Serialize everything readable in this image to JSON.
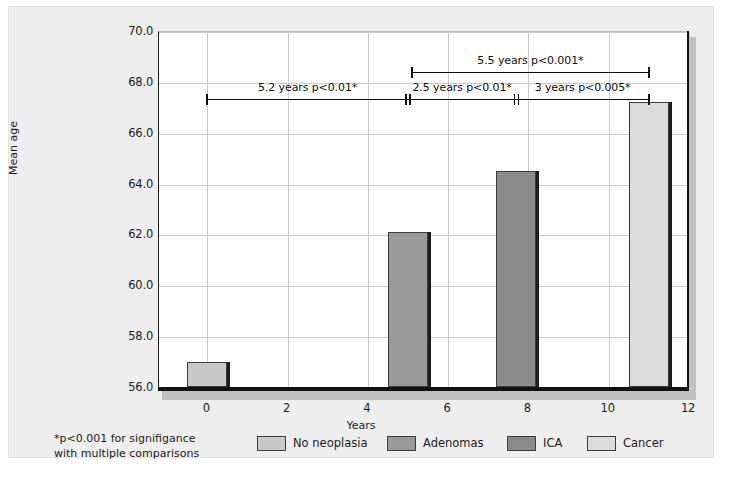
{
  "figure": {
    "background_color": "#eeeeee",
    "plot_background_color": "#ffffff"
  },
  "chart_data": {
    "type": "bar",
    "title": "",
    "xlabel": "Years",
    "ylabel": "Mean age",
    "xlim": [
      -1.2,
      12
    ],
    "ylim": [
      56.0,
      70.0
    ],
    "xticks": [
      "0",
      "2",
      "4",
      "6",
      "8",
      "10",
      "12"
    ],
    "xtick_values": [
      0,
      2,
      4,
      6,
      8,
      10,
      12
    ],
    "yticks": [
      "56.0",
      "58.0",
      "60.0",
      "62.0",
      "64.0",
      "66.0",
      "68.0",
      "70.0"
    ],
    "ytick_values": [
      56.0,
      58.0,
      60.0,
      62.0,
      64.0,
      66.0,
      68.0,
      70.0
    ],
    "grid": true,
    "legend_position": "bottom",
    "categories": [
      "No neoplasia",
      "Adenomas",
      "ICA",
      "Cancer"
    ],
    "values": [
      57.0,
      62.1,
      64.5,
      67.2
    ],
    "x": [
      0.0,
      5.0,
      7.7,
      11.0
    ],
    "bar_width_years": 1.0,
    "colors": [
      "#c8c8c8",
      "#9a9a9a",
      "#8a8a8a",
      "#dcdcdc"
    ],
    "series": [
      {
        "name": "No neoplasia",
        "x": 0.0,
        "value": 57.0,
        "color": "#c8c8c8"
      },
      {
        "name": "Adenomas",
        "x": 5.0,
        "value": 62.1,
        "color": "#9a9a9a"
      },
      {
        "name": "ICA",
        "x": 7.7,
        "value": 64.5,
        "color": "#8a8a8a"
      },
      {
        "name": "Cancer",
        "x": 11.0,
        "value": 67.2,
        "color": "#dcdcdc"
      }
    ],
    "annotations": [
      {
        "label": "5.2 years p<0.01*",
        "x_start": 0.0,
        "x_end": 5.0,
        "row": 2,
        "cap_left": "single",
        "cap_right": "double"
      },
      {
        "label": "5.5 years p<0.001*",
        "x_start": 5.1,
        "x_end": 11.0,
        "row": 1,
        "cap_left": "single",
        "cap_right": "single"
      },
      {
        "label": "2.5 years p<0.01*",
        "x_start": 5.0,
        "x_end": 7.7,
        "row": 2,
        "cap_left": "double",
        "cap_right": "double"
      },
      {
        "label": "3 years p<0.005*",
        "x_start": 7.7,
        "x_end": 11.0,
        "row": 2,
        "cap_left": "double",
        "cap_right": "single"
      }
    ]
  },
  "legend": {
    "note_line1": "*p<0.001 for signifigance",
    "note_line2": "with multiple comparisons",
    "items": [
      {
        "label": "No neoplasia",
        "color": "#c8c8c8"
      },
      {
        "label": "Adenomas",
        "color": "#9a9a9a"
      },
      {
        "label": "ICA",
        "color": "#8a8a8a"
      },
      {
        "label": "Cancer",
        "color": "#dcdcdc"
      }
    ]
  }
}
